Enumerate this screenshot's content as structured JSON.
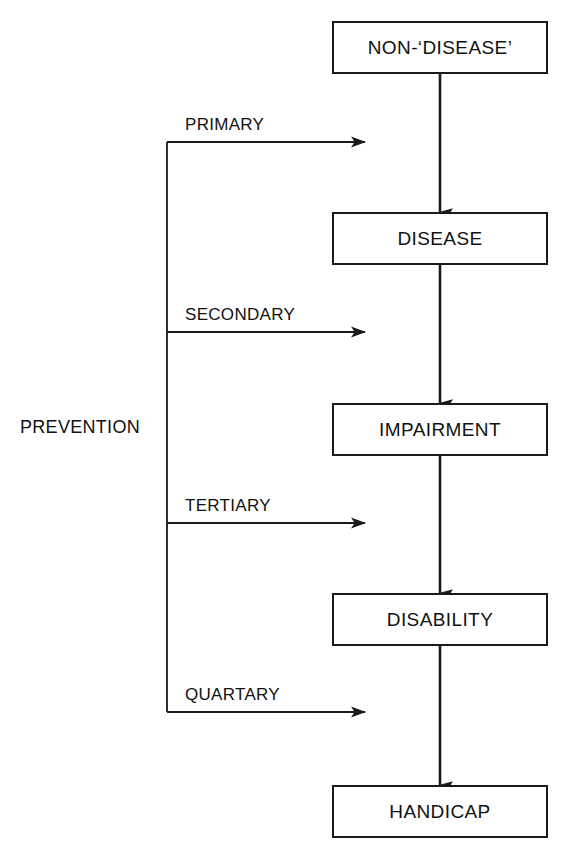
{
  "diagram": {
    "colors": {
      "stroke": "#1a1a1a",
      "text": "#111111",
      "background": "#ffffff"
    },
    "nodes": [
      {
        "id": "non-disease",
        "label": "NON-‘DISEASE’",
        "x": 332,
        "y": 21,
        "w": 216,
        "h": 53
      },
      {
        "id": "disease",
        "label": "DISEASE",
        "x": 332,
        "y": 212,
        "w": 216,
        "h": 53
      },
      {
        "id": "impairment",
        "label": "IMPAIRMENT",
        "x": 332,
        "y": 403,
        "w": 216,
        "h": 53
      },
      {
        "id": "disability",
        "label": "DISABILITY",
        "x": 332,
        "y": 593,
        "w": 216,
        "h": 53
      },
      {
        "id": "handicap",
        "label": "HANDICAP",
        "x": 332,
        "y": 785,
        "w": 216,
        "h": 53
      }
    ],
    "flow_arrows": [
      {
        "id": "non-disease-to-disease",
        "from": "non-disease",
        "to": "disease",
        "x": 440,
        "y1": 74,
        "y2": 212
      },
      {
        "id": "disease-to-impairment",
        "from": "disease",
        "to": "impairment",
        "x": 440,
        "y1": 265,
        "y2": 403
      },
      {
        "id": "impairment-to-disability",
        "from": "impairment",
        "to": "disability",
        "x": 440,
        "y1": 456,
        "y2": 593
      },
      {
        "id": "disability-to-handicap",
        "from": "disability",
        "to": "handicap",
        "x": 440,
        "y1": 646,
        "y2": 785
      }
    ],
    "spine": {
      "label": "PREVENTION",
      "x": 167,
      "y_top": 142,
      "y_bottom": 712,
      "label_x": 20,
      "label_y": 418
    },
    "branches": [
      {
        "id": "primary",
        "label": "PRIMARY",
        "y": 142,
        "x_start": 167,
        "x_end": 365,
        "label_x": 185,
        "label_y": 116
      },
      {
        "id": "secondary",
        "label": "SECONDARY",
        "y": 332,
        "x_start": 167,
        "x_end": 365,
        "label_x": 185,
        "label_y": 306
      },
      {
        "id": "tertiary",
        "label": "TERTIARY",
        "y": 523,
        "x_start": 167,
        "x_end": 365,
        "label_x": 185,
        "label_y": 497
      },
      {
        "id": "quartary",
        "label": "QUARTARY",
        "y": 712,
        "x_start": 167,
        "x_end": 365,
        "label_x": 185,
        "label_y": 686
      }
    ]
  }
}
